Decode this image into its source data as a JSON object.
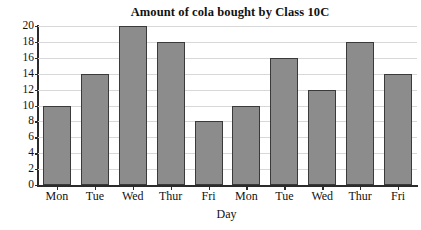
{
  "chart_data": {
    "type": "bar",
    "title": "Amount of cola bought by Class 10C",
    "xlabel": "Day",
    "ylabel": "Number of cans",
    "categories": [
      "Mon",
      "Tue",
      "Wed",
      "Thur",
      "Fri",
      "Mon",
      "Tue",
      "Wed",
      "Thur",
      "Fri"
    ],
    "values": [
      10,
      14,
      20,
      18,
      8,
      10,
      16,
      12,
      18,
      14
    ],
    "ylim": [
      0,
      20
    ],
    "ytick_values": [
      0,
      2,
      4,
      6,
      8,
      10,
      12,
      14,
      16,
      18,
      20
    ],
    "ytick_labels": [
      "0",
      "2",
      "4",
      "6",
      "8",
      "10",
      "12",
      "14",
      "16",
      "18",
      "20"
    ],
    "grid": true,
    "legend": null,
    "bar_color": "#8c8c8c",
    "bar_edge_color": "#3a3a3a",
    "grid_color": "#d8d8d8",
    "axis_color": "#2b2b2b",
    "background": "#ffffff"
  }
}
